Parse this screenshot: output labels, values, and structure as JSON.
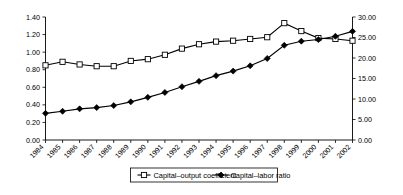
{
  "chart_data": {
    "type": "line",
    "title": "",
    "xlabel": "",
    "ylabel": "",
    "grid": false,
    "legend_position": "bottom",
    "categories": [
      "1984",
      "1985",
      "1986",
      "1987",
      "1988",
      "1989",
      "1990",
      "1991",
      "1992",
      "1993",
      "1994",
      "1995",
      "1996",
      "1997",
      "1998",
      "1999",
      "2000",
      "2001",
      "2002"
    ],
    "axes": {
      "left": {
        "ticks": [
          "0.00",
          "0.20",
          "0.40",
          "0.60",
          "0.80",
          "1.00",
          "1.20",
          "1.40"
        ],
        "values": [
          0.0,
          0.2,
          0.4,
          0.6,
          0.8,
          1.0,
          1.2,
          1.4
        ],
        "ylim": [
          0.0,
          1.4
        ]
      },
      "right": {
        "ticks": [
          "0.00",
          "5.00",
          "10.00",
          "15.00",
          "20.00",
          "25.00",
          "30.00"
        ],
        "values": [
          0.0,
          5.0,
          10.0,
          15.0,
          20.0,
          25.0,
          30.0
        ],
        "ylim": [
          0.0,
          30.0
        ]
      }
    },
    "series": [
      {
        "name": "Capital–output coefficient",
        "axis": "left",
        "marker": "open-square",
        "values": [
          0.85,
          0.89,
          0.86,
          0.84,
          0.84,
          0.9,
          0.92,
          0.97,
          1.04,
          1.09,
          1.12,
          1.13,
          1.15,
          1.17,
          1.33,
          1.24,
          1.16,
          1.15,
          1.13
        ]
      },
      {
        "name": "Capital–labor ratio",
        "axis": "right",
        "marker": "filled-diamond",
        "values": [
          6.5,
          7.0,
          7.6,
          7.9,
          8.4,
          9.3,
          10.4,
          11.6,
          13.0,
          14.3,
          15.7,
          16.8,
          18.1,
          19.9,
          23.1,
          24.1,
          24.5,
          25.3,
          26.5
        ]
      }
    ]
  },
  "legend": {
    "items": [
      {
        "label": "Capital–output coefficient",
        "marker": "open-square"
      },
      {
        "label": "Capital–labor ratio",
        "marker": "filled-diamond"
      }
    ]
  },
  "colors": {
    "axis": "#000000",
    "series1": "#000000",
    "series2": "#000000",
    "background": "#ffffff"
  }
}
